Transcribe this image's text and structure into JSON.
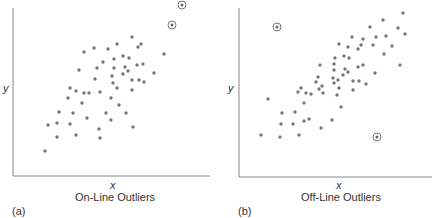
{
  "chart_data": [
    {
      "type": "scatter",
      "panel_label": "(a)",
      "title": "On-Line Outliers",
      "xlabel": "x",
      "ylabel": "y",
      "grid": false,
      "ticks": "none",
      "axis_px": {
        "x0": 13,
        "y0": 176,
        "x1": 210,
        "y1": 8
      },
      "point_color": "#777777",
      "outlier_marker": "circled",
      "points_px": [
        [
          45,
          151
        ],
        [
          48,
          125
        ],
        [
          57,
          137
        ],
        [
          57,
          123
        ],
        [
          59,
          112
        ],
        [
          68,
          98
        ],
        [
          70,
          88
        ],
        [
          70,
          124
        ],
        [
          73,
          113
        ],
        [
          76,
          135
        ],
        [
          76,
          91
        ],
        [
          79,
          70
        ],
        [
          82,
          103
        ],
        [
          84,
          52
        ],
        [
          84,
          93
        ],
        [
          87,
          118
        ],
        [
          89,
          93
        ],
        [
          94,
          48
        ],
        [
          95,
          79
        ],
        [
          97,
          68
        ],
        [
          99,
          129
        ],
        [
          100,
          92
        ],
        [
          100,
          138
        ],
        [
          103,
          62
        ],
        [
          106,
          113
        ],
        [
          108,
          49
        ],
        [
          111,
          98
        ],
        [
          112,
          76
        ],
        [
          113,
          83
        ],
        [
          111,
          120
        ],
        [
          114,
          59
        ],
        [
          114,
          68
        ],
        [
          117,
          44
        ],
        [
          117,
          88
        ],
        [
          119,
          105
        ],
        [
          123,
          74
        ],
        [
          123,
          56
        ],
        [
          125,
          67
        ],
        [
          126,
          113
        ],
        [
          128,
          71
        ],
        [
          129,
          58
        ],
        [
          132,
          37
        ],
        [
          132,
          90
        ],
        [
          132,
          80
        ],
        [
          133,
          127
        ],
        [
          137,
          65
        ],
        [
          138,
          47
        ],
        [
          139,
          80
        ],
        [
          141,
          44
        ],
        [
          143,
          64
        ],
        [
          144,
          82
        ],
        [
          154,
          73
        ],
        [
          164,
          54
        ]
      ],
      "outliers_px": [
        [
          172,
          25
        ],
        [
          182,
          5
        ]
      ]
    },
    {
      "type": "scatter",
      "panel_label": "(b)",
      "title": "Off-Line Outliers",
      "xlabel": "x",
      "ylabel": "y",
      "grid": false,
      "ticks": "none",
      "axis_px": {
        "x0": 23,
        "y0": 177,
        "x1": 216,
        "y1": 8
      },
      "point_color": "#777777",
      "outlier_marker": "circled",
      "points_px": [
        [
          45,
          135
        ],
        [
          52,
          99
        ],
        [
          64,
          137
        ],
        [
          65,
          124
        ],
        [
          66,
          113
        ],
        [
          77,
          124
        ],
        [
          79,
          112
        ],
        [
          82,
          92
        ],
        [
          83,
          135
        ],
        [
          85,
          88
        ],
        [
          88,
          103
        ],
        [
          88,
          121
        ],
        [
          90,
          93
        ],
        [
          93,
          119
        ],
        [
          95,
          94
        ],
        [
          100,
          82
        ],
        [
          102,
          77
        ],
        [
          103,
          89
        ],
        [
          104,
          65
        ],
        [
          105,
          128
        ],
        [
          106,
          86
        ],
        [
          107,
          93
        ],
        [
          116,
          120
        ],
        [
          117,
          78
        ],
        [
          118,
          83
        ],
        [
          118,
          70
        ],
        [
          118,
          64
        ],
        [
          119,
          58
        ],
        [
          121,
          95
        ],
        [
          122,
          80
        ],
        [
          123,
          44
        ],
        [
          123,
          88
        ],
        [
          125,
          107
        ],
        [
          127,
          75
        ],
        [
          128,
          56
        ],
        [
          129,
          69
        ],
        [
          132,
          72
        ],
        [
          132,
          47
        ],
        [
          133,
          58
        ],
        [
          136,
          37
        ],
        [
          137,
          81
        ],
        [
          137,
          90
        ],
        [
          142,
          49
        ],
        [
          142,
          67
        ],
        [
          143,
          81
        ],
        [
          145,
          45
        ],
        [
          147,
          39
        ],
        [
          147,
          65
        ],
        [
          150,
          84
        ],
        [
          154,
          27
        ],
        [
          157,
          45
        ],
        [
          159,
          73
        ],
        [
          160,
          37
        ],
        [
          167,
          20
        ],
        [
          168,
          54
        ],
        [
          170,
          36
        ],
        [
          176,
          46
        ],
        [
          182,
          28
        ],
        [
          184,
          65
        ],
        [
          187,
          13
        ],
        [
          189,
          34
        ]
      ],
      "outliers_px": [
        [
          61,
          27
        ],
        [
          161,
          137
        ]
      ]
    }
  ]
}
